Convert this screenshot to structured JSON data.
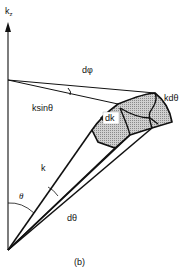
{
  "figure": {
    "caption": "(b)",
    "labels": {
      "axis": "k",
      "axis_sub": "z",
      "dphi": "dφ",
      "kdtheta": "kdθ",
      "ksintheta": "ksinθ",
      "dk": "dk",
      "k": "k",
      "theta": "θ",
      "dtheta": "dθ"
    },
    "colors": {
      "line": "#111111",
      "shade": "#b8b8b8",
      "background": "#ffffff"
    }
  }
}
